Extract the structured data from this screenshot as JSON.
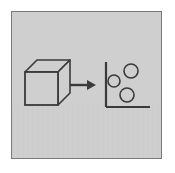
{
  "figure": {
    "panel": {
      "background_color": "#cfcfcf",
      "border_color": "#7a7a7a",
      "outer_background_color": "#ffffff",
      "ink_color": "#3a3a3a"
    }
  },
  "cube": {
    "label": "3D wireframe cube",
    "front_face": {
      "x": 25,
      "y": 72,
      "width": 33,
      "height": 33
    },
    "depth_offset": {
      "dx": 12,
      "dy": -12
    },
    "stroke_color": "#3a3a3a",
    "fill_color": "#cfcfcf"
  },
  "arrow": {
    "label": "right arrow",
    "direction": "right",
    "x_start": 70,
    "x_end": 95,
    "y": 85,
    "color": "#3a3a3a"
  },
  "plot": {
    "label": "2D scatter plot",
    "axis_color": "#3a3a3a",
    "origin": {
      "x": 106,
      "y": 107
    },
    "y_axis_top": 62,
    "x_axis_right": 150,
    "point_stroke_color": "#3a3a3a",
    "point_fill_color": "#cfcfcf",
    "points": [
      {
        "id": "point-1",
        "cx": 114,
        "cy": 81,
        "r": 6
      },
      {
        "id": "point-2",
        "cx": 131,
        "cy": 71,
        "r": 7
      },
      {
        "id": "point-3",
        "cx": 127,
        "cy": 95,
        "r": 7
      }
    ]
  }
}
